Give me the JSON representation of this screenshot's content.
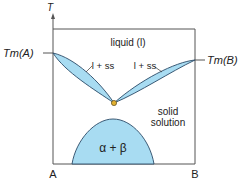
{
  "diagram": {
    "type": "binary phase diagram",
    "axis": {
      "y_label": "T",
      "x_left": "A",
      "x_right": "B"
    },
    "labels": {
      "tm_a": "Tm(A)",
      "tm_b": "Tm(B)",
      "liquid": "liquid (l)",
      "l_ss_left": "l + ss",
      "l_ss_right": "l + ss",
      "solid_1": "solid",
      "solid_2": "solution",
      "alpha_beta": "α + β"
    },
    "colors": {
      "region_fill": "#a8dcf2",
      "outline": "#2a4a66",
      "frame": "#555555",
      "min_point": "#e0b030"
    }
  }
}
